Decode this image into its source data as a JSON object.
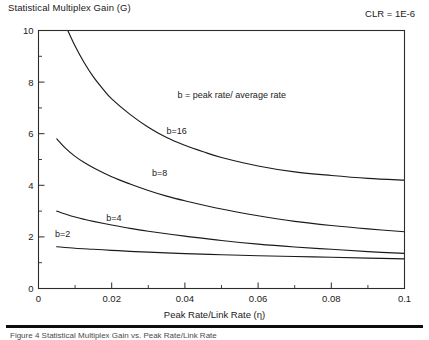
{
  "figure": {
    "title": "Statistical Multiplex Gain (G)",
    "clr_note": "CLR = 1E-6",
    "caption": "Figure 4  Statistical Multiplex Gain vs. Peak Rate/Link Rate"
  },
  "chart_data": {
    "type": "line",
    "title": "Statistical Multiplex Gain (G)",
    "xlabel": "Peak Rate/Link Rate (η)",
    "ylabel": "Statistical Multiplex Gain (G)",
    "xlim": [
      0,
      0.1
    ],
    "ylim": [
      0,
      10
    ],
    "xticks": [
      0,
      0.02,
      0.04,
      0.06,
      0.08,
      0.1
    ],
    "xticklabels": [
      "0",
      "0.02",
      "0.04",
      "0.06",
      "0.08",
      "0.1"
    ],
    "xminor_step": 0.01,
    "yticks": [
      0,
      2,
      4,
      6,
      8,
      10
    ],
    "yticklabels": [
      "0",
      "2",
      "4",
      "6",
      "8",
      "10"
    ],
    "yminor_step": 1,
    "grid": false,
    "legend": "inline-curve-labels",
    "annotations": [
      {
        "text": "b = peak rate/ average rate",
        "x": 0.038,
        "y": 7.4
      }
    ],
    "series": [
      {
        "name": "b=16",
        "label": "b=16",
        "label_x": 0.035,
        "label_y": 6.0,
        "x": [
          0.008,
          0.01,
          0.0125,
          0.015,
          0.0175,
          0.02,
          0.025,
          0.03,
          0.035,
          0.04,
          0.045,
          0.05,
          0.06,
          0.07,
          0.08,
          0.09,
          0.1
        ],
        "y": [
          10.0,
          9.4,
          8.75,
          8.2,
          7.75,
          7.35,
          6.75,
          6.25,
          5.85,
          5.55,
          5.3,
          5.08,
          4.75,
          4.52,
          4.38,
          4.27,
          4.2
        ]
      },
      {
        "name": "b=8",
        "label": "b=8",
        "label_x": 0.031,
        "label_y": 4.35,
        "x": [
          0.005,
          0.0075,
          0.01,
          0.0125,
          0.015,
          0.02,
          0.025,
          0.03,
          0.035,
          0.04,
          0.05,
          0.06,
          0.07,
          0.08,
          0.09,
          0.1
        ],
        "y": [
          5.8,
          5.42,
          5.12,
          4.88,
          4.68,
          4.33,
          4.05,
          3.8,
          3.58,
          3.4,
          3.08,
          2.82,
          2.6,
          2.44,
          2.31,
          2.2
        ]
      },
      {
        "name": "b=4",
        "label": "b=4",
        "label_x": 0.0185,
        "label_y": 2.62,
        "x": [
          0.005,
          0.0075,
          0.01,
          0.0125,
          0.015,
          0.02,
          0.025,
          0.03,
          0.035,
          0.04,
          0.05,
          0.06,
          0.07,
          0.08,
          0.09,
          0.1
        ],
        "y": [
          3.0,
          2.88,
          2.77,
          2.68,
          2.6,
          2.46,
          2.33,
          2.22,
          2.12,
          2.03,
          1.86,
          1.72,
          1.61,
          1.52,
          1.43,
          1.36
        ]
      },
      {
        "name": "b=2",
        "label": "b=2",
        "label_x": 0.0045,
        "label_y": 2.0,
        "x": [
          0.005,
          0.01,
          0.015,
          0.02,
          0.025,
          0.03,
          0.04,
          0.05,
          0.06,
          0.07,
          0.08,
          0.09,
          0.1
        ],
        "y": [
          1.62,
          1.56,
          1.52,
          1.48,
          1.44,
          1.41,
          1.35,
          1.31,
          1.27,
          1.24,
          1.21,
          1.18,
          1.15
        ]
      }
    ]
  }
}
